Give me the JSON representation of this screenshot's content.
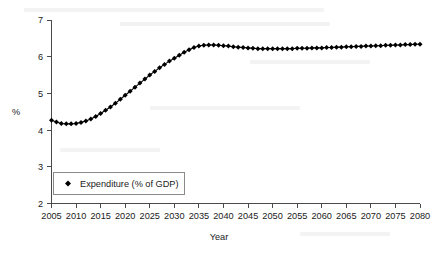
{
  "chart_data": {
    "type": "line",
    "title": "",
    "xlabel": "Year",
    "ylabel": "%",
    "xlim": [
      2005,
      2080
    ],
    "ylim": [
      2,
      7
    ],
    "grid": false,
    "legend_position": "inside-bottom-left",
    "marker": "diamond",
    "xticks": [
      "2005",
      "2010",
      "2015",
      "2020",
      "2025",
      "2030",
      "2035",
      "2040",
      "2045",
      "2050",
      "2055",
      "2060",
      "2065",
      "2070",
      "2075",
      "2080"
    ],
    "yticks": [
      "2",
      "3",
      "4",
      "5",
      "6",
      "7"
    ],
    "series": [
      {
        "name": "Expenditure (% of GDP)",
        "color": "#000000",
        "x": [
          2005,
          2006,
          2007,
          2008,
          2009,
          2010,
          2011,
          2012,
          2013,
          2014,
          2015,
          2016,
          2017,
          2018,
          2019,
          2020,
          2021,
          2022,
          2023,
          2024,
          2025,
          2026,
          2027,
          2028,
          2029,
          2030,
          2031,
          2032,
          2033,
          2034,
          2035,
          2036,
          2037,
          2038,
          2039,
          2040,
          2041,
          2042,
          2043,
          2044,
          2045,
          2046,
          2047,
          2048,
          2049,
          2050,
          2051,
          2052,
          2053,
          2054,
          2055,
          2056,
          2057,
          2058,
          2059,
          2060,
          2061,
          2062,
          2063,
          2064,
          2065,
          2066,
          2067,
          2068,
          2069,
          2070,
          2071,
          2072,
          2073,
          2074,
          2075,
          2076,
          2077,
          2078,
          2079,
          2080
        ],
        "values": [
          4.27,
          4.22,
          4.18,
          4.17,
          4.17,
          4.18,
          4.21,
          4.25,
          4.3,
          4.37,
          4.45,
          4.54,
          4.63,
          4.73,
          4.84,
          4.95,
          5.06,
          5.17,
          5.28,
          5.39,
          5.5,
          5.6,
          5.7,
          5.79,
          5.88,
          5.96,
          6.04,
          6.12,
          6.19,
          6.25,
          6.29,
          6.31,
          6.32,
          6.32,
          6.31,
          6.3,
          6.29,
          6.27,
          6.26,
          6.25,
          6.24,
          6.23,
          6.22,
          6.22,
          6.22,
          6.22,
          6.22,
          6.22,
          6.22,
          6.22,
          6.23,
          6.23,
          6.23,
          6.24,
          6.24,
          6.24,
          6.25,
          6.25,
          6.26,
          6.26,
          6.27,
          6.27,
          6.28,
          6.28,
          6.29,
          6.29,
          6.3,
          6.3,
          6.31,
          6.31,
          6.32,
          6.32,
          6.33,
          6.33,
          6.34,
          6.34
        ]
      }
    ],
    "legend": [
      {
        "label": "Expenditure (% of GDP)",
        "marker": "diamond",
        "color": "#000000"
      }
    ]
  }
}
